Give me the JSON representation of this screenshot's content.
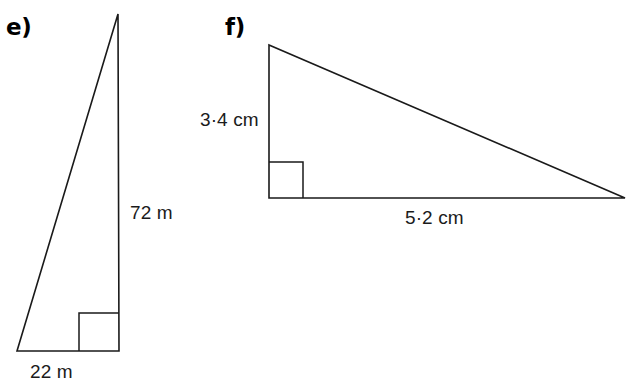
{
  "page": {
    "background_color": "#ffffff",
    "ink_color": "#1a1a1a",
    "width": 632,
    "height": 382
  },
  "figures": [
    {
      "id": "e",
      "part_label": "e)",
      "shape": "right-triangle",
      "orientation": "tall-narrow, right angle at bottom-right",
      "vertices": {
        "apex": [
          118,
          14
        ],
        "bottom_left": [
          17,
          351
        ],
        "bottom_right": [
          119,
          351
        ]
      },
      "right_angle_marker": {
        "x": 79,
        "y": 313,
        "width": 40,
        "height": 38,
        "at_vertex": "bottom_right"
      },
      "dimensions": [
        {
          "name": "vertical-leg",
          "value": "72 m",
          "side": "right",
          "position": [
            130,
            203
          ]
        },
        {
          "name": "base-leg",
          "value": "22 m",
          "side": "below",
          "position": [
            30,
            362
          ]
        }
      ]
    },
    {
      "id": "f",
      "part_label": "f)",
      "shape": "right-triangle",
      "orientation": "wide-flat, right angle at bottom-left",
      "vertices": {
        "top_left": [
          269,
          45
        ],
        "bottom_left": [
          269,
          198
        ],
        "bottom_right": [
          625,
          198
        ]
      },
      "right_angle_marker": {
        "x": 269,
        "y": 162,
        "width": 34,
        "height": 36,
        "at_vertex": "bottom_left"
      },
      "dimensions": [
        {
          "name": "vertical-leg",
          "value": "3·4 cm",
          "side": "left",
          "position": [
            200,
            110
          ]
        },
        {
          "name": "base-leg",
          "value": "5·2 cm",
          "side": "below",
          "position": [
            405,
            208
          ]
        }
      ]
    }
  ]
}
